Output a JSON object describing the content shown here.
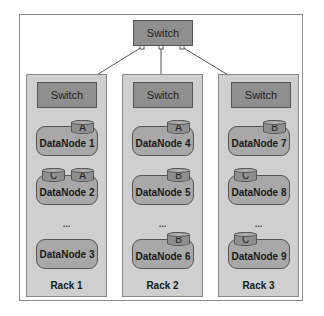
{
  "core_switch": {
    "label": "Switch"
  },
  "racks": [
    {
      "label": "Rack 1",
      "switch_label": "Switch",
      "nodes": [
        {
          "label": "DataNode 1",
          "blocks": [
            "A"
          ]
        },
        {
          "label": "DataNode 2",
          "blocks": [
            "C",
            "A"
          ]
        },
        {
          "label": "DataNode 3",
          "blocks": []
        }
      ],
      "ellipsis": "..."
    },
    {
      "label": "Rack 2",
      "switch_label": "Switch",
      "nodes": [
        {
          "label": "DataNode 4",
          "blocks": [
            "A"
          ]
        },
        {
          "label": "DataNode 5",
          "blocks": [
            "B"
          ]
        },
        {
          "label": "DataNode 6",
          "blocks": [
            "B"
          ]
        }
      ],
      "ellipsis": "..."
    },
    {
      "label": "Rack 3",
      "switch_label": "Switch",
      "nodes": [
        {
          "label": "DataNode 7",
          "blocks": [
            "B"
          ]
        },
        {
          "label": "DataNode 8",
          "blocks": [
            "C"
          ]
        },
        {
          "label": "DataNode 9",
          "blocks": [
            "C"
          ]
        }
      ],
      "ellipsis": "..."
    }
  ],
  "colors": {
    "switch_fill": "#8f8f8f",
    "rack_fill": "#cfcfcf",
    "node_fill": "#a8a8a8",
    "border": "#555555"
  }
}
